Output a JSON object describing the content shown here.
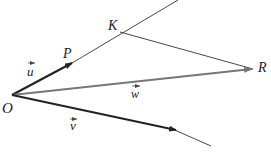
{
  "diagram": {
    "points": {
      "O": {
        "label": "O",
        "x": 12,
        "y": 95
      },
      "P": {
        "label": "P",
        "x": 72,
        "y": 63
      },
      "K": {
        "label": "K",
        "x": 122,
        "y": 31
      },
      "R": {
        "label": "R",
        "x": 253,
        "y": 69
      }
    },
    "vectors": {
      "u": {
        "label": "u",
        "arrow": "→"
      },
      "v": {
        "label": "v",
        "arrow": "→"
      },
      "w": {
        "label": "w",
        "arrow": "→"
      }
    },
    "colors": {
      "dark_line": "#222222",
      "gray_vector": "#777777",
      "thin_line": "#333333"
    }
  }
}
